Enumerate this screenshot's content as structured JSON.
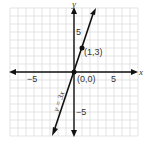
{
  "chart_data": {
    "type": "line",
    "title": "",
    "xlabel": "x",
    "ylabel": "y",
    "xlim": [
      -8,
      8
    ],
    "ylim": [
      -8,
      8
    ],
    "grid": true,
    "x_ticks_labeled": [
      "-5",
      "5"
    ],
    "y_ticks_labeled": [
      "5",
      "-5"
    ],
    "series": [
      {
        "name": "y = 3x",
        "equation": "y = 3x",
        "x": [
          -2.67,
          2.67
        ],
        "y": [
          -8,
          8
        ]
      }
    ],
    "points": [
      {
        "label": "(1,3)",
        "x": 1,
        "y": 3
      },
      {
        "label": "(0,0)",
        "x": 0,
        "y": 0
      }
    ]
  },
  "labels": {
    "x_axis": "x",
    "y_axis": "y",
    "x_neg5": "−5",
    "x_pos5": "5",
    "y_pos5": "5",
    "y_neg5": "−5",
    "point_a": "(1,3)",
    "origin": "(0,0)",
    "equation": "y = 3x"
  },
  "colors": {
    "grid": "#d9d9d9",
    "axis": "#111111",
    "line": "#111111"
  }
}
